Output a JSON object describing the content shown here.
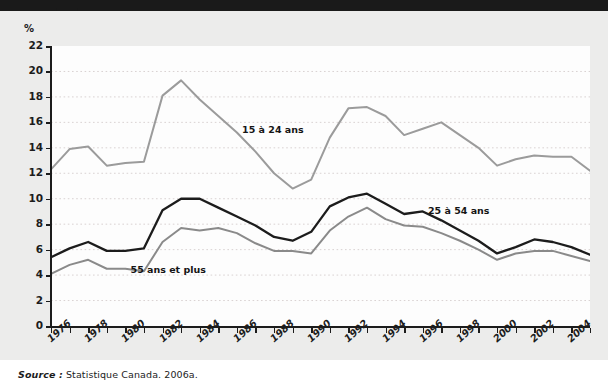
{
  "figure": {
    "unit_label": "%",
    "source_prefix": "Source :",
    "source_text": "Statistique Canada. 2006a.",
    "background_color": "#ececeb",
    "plot_background_color": "#fdfdfd",
    "grid_color": "#d9d2d2",
    "axis_color": "#1c1c1c"
  },
  "chart_data": {
    "type": "line",
    "title": "",
    "xlabel": "",
    "ylabel": "%",
    "ylim": [
      0,
      22
    ],
    "ytick_step": 2,
    "yticks": [
      "0",
      "2",
      "4",
      "6",
      "8",
      "10",
      "12",
      "14",
      "16",
      "18",
      "20",
      "22"
    ],
    "xlim": [
      1976,
      2005
    ],
    "xticks": [
      "1976",
      "1978",
      "1980",
      "1982",
      "1984",
      "1986",
      "1988",
      "1990",
      "1992",
      "1994",
      "1996",
      "1998",
      "2000",
      "2002",
      "2004"
    ],
    "grid": true,
    "legend_position": "inline-annotations",
    "x": [
      1976,
      1977,
      1978,
      1979,
      1980,
      1981,
      1982,
      1983,
      1984,
      1985,
      1986,
      1987,
      1988,
      1989,
      1990,
      1991,
      1992,
      1993,
      1994,
      1995,
      1996,
      1997,
      1998,
      1999,
      2000,
      2001,
      2002,
      2003,
      2004,
      2005
    ],
    "series": [
      {
        "name": "15 à 24 ans",
        "color": "#9b9b9b",
        "label_x": 1988,
        "label_y": 15.4,
        "values": [
          12.3,
          13.9,
          14.1,
          12.6,
          12.8,
          12.9,
          18.1,
          19.3,
          17.8,
          16.5,
          15.2,
          13.7,
          12.0,
          10.8,
          11.5,
          14.8,
          17.1,
          17.2,
          16.5,
          15.0,
          15.5,
          16.0,
          15.0,
          14.0,
          12.6,
          13.1,
          13.4,
          13.3,
          13.3,
          12.2
        ]
      },
      {
        "name": "25 à 54 ans",
        "color": "#1c1c1c",
        "label_x": 1998,
        "label_y": 9.0,
        "values": [
          5.4,
          6.1,
          6.6,
          5.9,
          5.9,
          6.1,
          9.1,
          10.0,
          10.0,
          9.3,
          8.6,
          7.9,
          7.0,
          6.7,
          7.4,
          9.4,
          10.1,
          10.4,
          9.6,
          8.8,
          9.0,
          8.3,
          7.5,
          6.7,
          5.7,
          6.2,
          6.8,
          6.6,
          6.2,
          5.6
        ]
      },
      {
        "name": "55 ans et plus",
        "color": "#8a8a8a",
        "label_x": 1982,
        "label_y": 4.4,
        "values": [
          4.1,
          4.8,
          5.2,
          4.5,
          4.5,
          4.3,
          6.6,
          7.7,
          7.5,
          7.7,
          7.3,
          6.5,
          5.9,
          5.9,
          5.7,
          7.5,
          8.6,
          9.3,
          8.4,
          7.9,
          7.8,
          7.3,
          6.7,
          6.0,
          5.2,
          5.7,
          5.9,
          5.9,
          5.5,
          5.1
        ]
      }
    ]
  }
}
